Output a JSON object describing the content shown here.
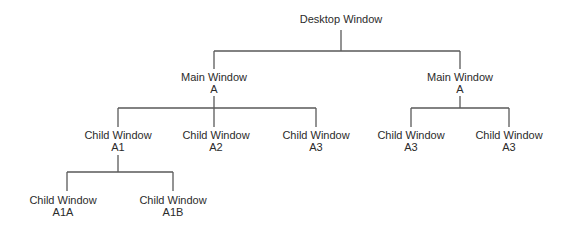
{
  "diagram": {
    "type": "tree",
    "nodes": {
      "desktop": {
        "line1": "Desktop Window",
        "line2": ""
      },
      "main_left": {
        "line1": "Main Window",
        "line2": "A"
      },
      "main_right": {
        "line1": "Main Window",
        "line2": "A"
      },
      "child_a1": {
        "line1": "Child Window",
        "line2": "A1"
      },
      "child_a2": {
        "line1": "Child Window",
        "line2": "A2"
      },
      "child_a3": {
        "line1": "Child Window",
        "line2": "A3"
      },
      "child_right_1": {
        "line1": "Child Window",
        "line2": "A3"
      },
      "child_right_2": {
        "line1": "Child Window",
        "line2": "A3"
      },
      "child_a1a": {
        "line1": "Child Window",
        "line2": "A1A"
      },
      "child_a1b": {
        "line1": "Child Window",
        "line2": "A1B"
      }
    },
    "edges": [
      [
        "desktop",
        "main_left"
      ],
      [
        "desktop",
        "main_right"
      ],
      [
        "main_left",
        "child_a1"
      ],
      [
        "main_left",
        "child_a2"
      ],
      [
        "main_left",
        "child_a3"
      ],
      [
        "main_right",
        "child_right_1"
      ],
      [
        "main_right",
        "child_right_2"
      ],
      [
        "child_a1",
        "child_a1a"
      ],
      [
        "child_a1",
        "child_a1b"
      ]
    ],
    "colors": {
      "line": "#5a5a5a",
      "text": "#2b2b2b",
      "background": "#ffffff"
    }
  }
}
